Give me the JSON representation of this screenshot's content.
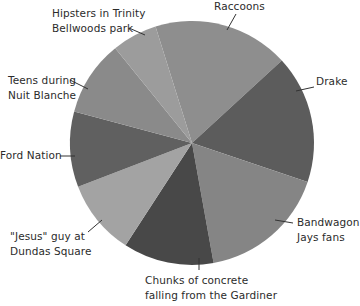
{
  "chart_data": {
    "type": "pie",
    "title": "",
    "start_angle_deg": -17.4,
    "direction": "clockwise",
    "categories": [
      "Raccoons",
      "Drake",
      "Bandwagon Jays fans",
      "Chunks of concrete falling from the Gardiner",
      "\"Jesus\" guy at Dundas Square",
      "Ford Nation",
      "Teens during Nuit Blanche",
      "Hipsters in Trinity Bellwoods park"
    ],
    "values": [
      18,
      17,
      17,
      12,
      10,
      10,
      10,
      6
    ],
    "colors": [
      "#8e8e8e",
      "#5c5c5c",
      "#858585",
      "#484848",
      "#a3a3a3",
      "#606060",
      "#8a8a8a",
      "#9c9c9c"
    ],
    "legend": "none (leader-line labels)",
    "grid": false
  },
  "labels": {
    "raccoons": [
      "Raccoons"
    ],
    "drake": [
      "Drake"
    ],
    "bandwagon": [
      "Bandwagon",
      "Jays fans"
    ],
    "chunks": [
      "Chunks of concrete",
      "falling from the Gardiner"
    ],
    "jesus": [
      "\"Jesus\" guy at",
      "Dundas Square"
    ],
    "ford": [
      "Ford Nation"
    ],
    "teens": [
      "Teens during",
      "Nuit Blanche"
    ],
    "hipsters": [
      "Hipsters in Trinity",
      "Bellwoods park"
    ]
  }
}
